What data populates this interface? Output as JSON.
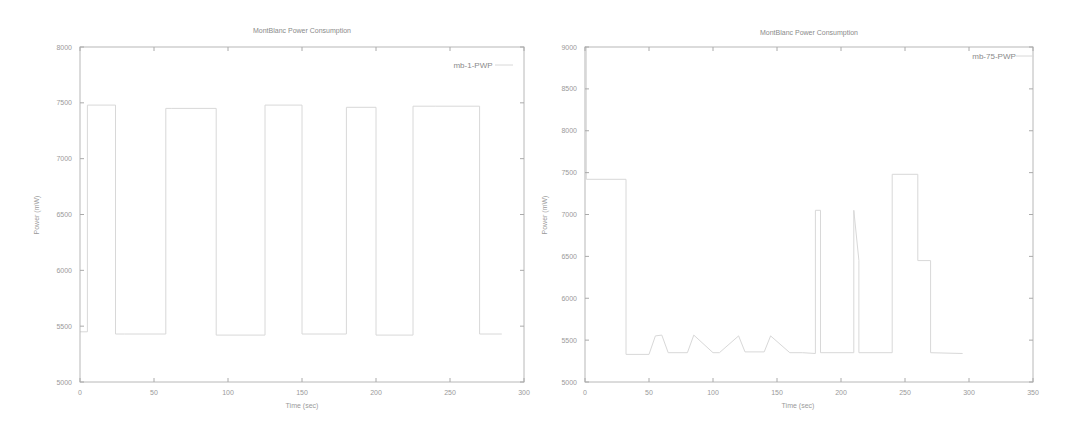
{
  "chart_data": [
    {
      "type": "line",
      "title": "MontBlanc Power Consumption",
      "xlabel": "Time (sec)",
      "ylabel": "Power (mW)",
      "xlim": [
        0,
        300
      ],
      "ylim": [
        5000,
        8000
      ],
      "xticks": [
        0,
        50,
        100,
        150,
        200,
        250,
        300
      ],
      "yticks": [
        5000,
        5500,
        6000,
        6500,
        7000,
        7500,
        8000
      ],
      "grid": false,
      "legend_position": "top-right",
      "series": [
        {
          "name": "mb-1-PWP",
          "color": "#d8d8d8",
          "x": [
            0,
            5,
            5,
            24,
            24,
            30,
            30,
            58,
            58,
            62,
            62,
            92,
            92,
            125,
            125,
            150,
            150,
            180,
            180,
            200,
            200,
            225,
            225,
            240,
            240,
            270,
            270,
            285
          ],
          "y": [
            5450,
            5450,
            7480,
            7480,
            5430,
            5430,
            5430,
            5430,
            7450,
            7450,
            7450,
            7450,
            5420,
            5420,
            7480,
            7480,
            5430,
            5430,
            7460,
            7460,
            5420,
            5420,
            7470,
            7470,
            7470,
            7470,
            5430,
            5430
          ]
        }
      ]
    },
    {
      "type": "line",
      "title": "MontBlanc Power Consumption",
      "xlabel": "Time (sec)",
      "ylabel": "Power (mW)",
      "xlim": [
        0,
        350
      ],
      "ylim": [
        5000,
        9000
      ],
      "xticks": [
        0,
        50,
        100,
        150,
        200,
        250,
        300,
        350
      ],
      "yticks": [
        5000,
        5500,
        6000,
        6500,
        7000,
        7500,
        8000,
        8500,
        9000
      ],
      "grid": false,
      "legend_position": "top-right",
      "series": [
        {
          "name": "mb-75-PWP",
          "color": "#d8d8d8",
          "x": [
            0,
            1,
            1,
            32,
            32,
            50,
            55,
            60,
            65,
            80,
            85,
            100,
            105,
            120,
            125,
            140,
            145,
            160,
            170,
            180,
            180,
            184,
            184,
            210,
            210,
            214,
            214,
            240,
            240,
            260,
            260,
            270,
            270,
            295
          ],
          "y": [
            9000,
            9000,
            7420,
            7420,
            5330,
            5330,
            5550,
            5560,
            5350,
            5350,
            5560,
            5350,
            5350,
            5550,
            5360,
            5360,
            5550,
            5350,
            5350,
            5340,
            7050,
            7050,
            5350,
            5350,
            7050,
            6450,
            5350,
            5350,
            7480,
            7480,
            6450,
            6450,
            5350,
            5340
          ]
        }
      ]
    }
  ],
  "charts": [
    {
      "title": "MontBlanc Power Consumption",
      "xlabel": "Time (sec)",
      "ylabel": "Power (mW)",
      "legend": "mb-1-PWP",
      "xtick_labels": [
        "0",
        "50",
        "100",
        "150",
        "200",
        "250",
        "300"
      ],
      "ytick_labels": [
        "5000",
        "5500",
        "6000",
        "6500",
        "7000",
        "7500",
        "8000"
      ]
    },
    {
      "title": "MontBlanc Power Consumption",
      "xlabel": "Time (sec)",
      "ylabel": "Power (mW)",
      "legend": "mb-75-PWP",
      "xtick_labels": [
        "0",
        "50",
        "100",
        "150",
        "200",
        "250",
        "300",
        "350"
      ],
      "ytick_labels": [
        "5000",
        "5500",
        "6000",
        "6500",
        "7000",
        "7500",
        "8000",
        "8500",
        "9000"
      ]
    }
  ]
}
